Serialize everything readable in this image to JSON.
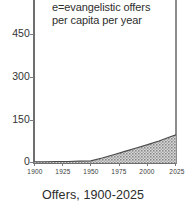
{
  "caption": "Offers, 1900-2025",
  "annotation": {
    "line1": "e=evangelistic offers",
    "line2": "per capita per year"
  },
  "colors": {
    "axis": "#6e6e6e",
    "text": "#2b2b2b",
    "fill": "#9a9a9a",
    "outline": "#555555",
    "background": "#ffffff"
  },
  "chart_data": {
    "type": "area",
    "title": "Offers, 1900-2025",
    "xlabel": "",
    "ylabel": "",
    "xlim": [
      1900,
      2025
    ],
    "ylim": [
      0,
      500
    ],
    "grid": false,
    "legend": "none",
    "annotations": [
      "e=evangelistic offers per capita per year"
    ],
    "xticks": [
      1900,
      1925,
      1950,
      1975,
      2000,
      2025
    ],
    "xticklabels": [
      "1900",
      "1925",
      "1950",
      "1975",
      "2000",
      "2025"
    ],
    "yticks": [
      0,
      150,
      300,
      450
    ],
    "yticklabels": [
      "0",
      "150",
      "300",
      "450"
    ],
    "series": [
      {
        "name": "e = evangelistic offers per capita per year",
        "x": [
          1900,
          1910,
          1920,
          1930,
          1940,
          1950,
          1960,
          1970,
          1980,
          1990,
          2000,
          2010,
          2020,
          2025
        ],
        "values": [
          1,
          1,
          2,
          2,
          3,
          4,
          14,
          26,
          38,
          50,
          62,
          75,
          90,
          97
        ]
      }
    ]
  }
}
